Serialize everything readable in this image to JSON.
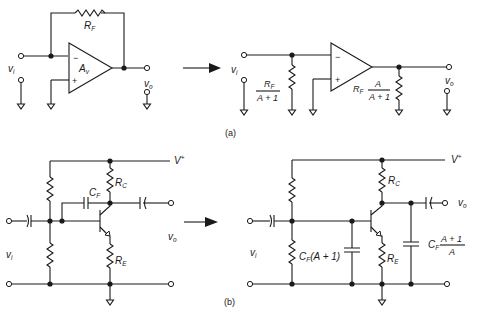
{
  "figure": {
    "panel_a": {
      "caption": "(a)",
      "left": {
        "input_label": "v",
        "input_sub": "i",
        "output_label": "v",
        "output_sub": "o",
        "feedback_resistor": "R",
        "feedback_resistor_sub": "F",
        "amp_gain": "A",
        "amp_gain_sub": "v",
        "minus_sign": "−",
        "plus_sign": "+"
      },
      "right": {
        "input_label": "v",
        "input_sub": "i",
        "output_label": "v",
        "output_sub": "o",
        "input_resistor_num": "R",
        "input_resistor_num_sub": "F",
        "input_resistor_den": "A + 1",
        "output_resistor_prefix": "R",
        "output_resistor_prefix_sub": "F",
        "output_resistor_num": "A",
        "output_resistor_den": "A + 1",
        "minus_sign": "−",
        "plus_sign": "+"
      }
    },
    "panel_b": {
      "caption": "(b)",
      "left": {
        "supply_label": "V",
        "supply_sup": "+",
        "collector_resistor": "R",
        "collector_resistor_sub": "C",
        "emitter_resistor": "R",
        "emitter_resistor_sub": "E",
        "feedback_cap": "C",
        "feedback_cap_sub": "F",
        "input_label": "v",
        "input_sub": "i",
        "output_label": "v",
        "output_sub": "o"
      },
      "right": {
        "supply_label": "V",
        "supply_sup": "+",
        "collector_resistor": "R",
        "collector_resistor_sub": "C",
        "emitter_resistor": "R",
        "emitter_resistor_sub": "E",
        "input_cap_prefix": "C",
        "input_cap_prefix_sub": "F",
        "input_cap_rest": "(A + 1)",
        "output_cap_prefix": "C",
        "output_cap_prefix_sub": "F",
        "output_cap_num": "A + 1",
        "output_cap_den": "A",
        "input_label": "v",
        "input_sub": "i",
        "output_label": "v",
        "output_sub": "o"
      }
    },
    "arrows": [
      "transform-arrow-a",
      "transform-arrow-b"
    ],
    "colors": {
      "ink": "#1a1a1a",
      "background": "#ffffff"
    }
  }
}
